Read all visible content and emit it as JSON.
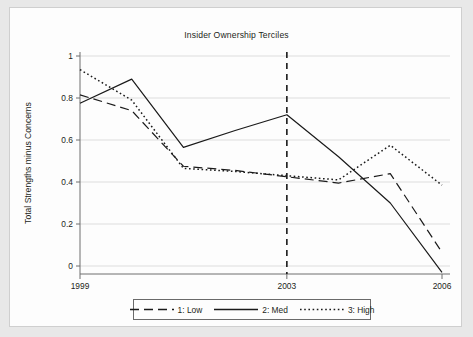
{
  "figure": {
    "background_color": "#e8e8e8",
    "panel_color": "#fdfdfd",
    "border_color": "#cfcfcf"
  },
  "chart_data": {
    "type": "line",
    "title": "Insider Ownership Terciles",
    "xlabel": "",
    "ylabel": "Total Strengths minus Concerns",
    "x": [
      1999,
      2000,
      2001,
      2002,
      2003,
      2004,
      2005,
      2006
    ],
    "xlim": [
      1999,
      2006
    ],
    "ylim": [
      -0.07,
      1.05
    ],
    "xticks": [
      1999,
      2003,
      2006
    ],
    "xtick_labels": [
      "1999",
      "2003",
      "2006"
    ],
    "yticks": [
      0,
      0.2,
      0.4,
      0.6,
      0.8,
      1
    ],
    "ytick_labels": [
      "0",
      "0.2",
      "0.4",
      "0.6",
      "0.8",
      "1"
    ],
    "grid": "horizontal",
    "grid_color": "#d9d9d9",
    "legend_position": "below-outside",
    "annotations": [
      {
        "name": "reference-line-2003",
        "type": "vline",
        "x": 2003,
        "style": "dashed",
        "color": "#1a1a1a"
      }
    ],
    "series": [
      {
        "name": "1: Low",
        "label": "1: Low",
        "style": "dashed",
        "color": "#1a1a1a",
        "values": [
          0.815,
          0.74,
          0.475,
          0.455,
          0.425,
          0.395,
          0.44,
          0.065
        ]
      },
      {
        "name": "2: Med",
        "label": "2: Med",
        "style": "solid",
        "color": "#1a1a1a",
        "values": [
          0.775,
          0.89,
          0.565,
          0.645,
          0.72,
          0.52,
          0.3,
          -0.03
        ]
      },
      {
        "name": "3: High",
        "label": "3: High",
        "style": "dotted",
        "color": "#1a1a1a",
        "values": [
          0.935,
          0.79,
          0.465,
          0.45,
          0.43,
          0.41,
          0.575,
          0.385
        ]
      }
    ]
  }
}
